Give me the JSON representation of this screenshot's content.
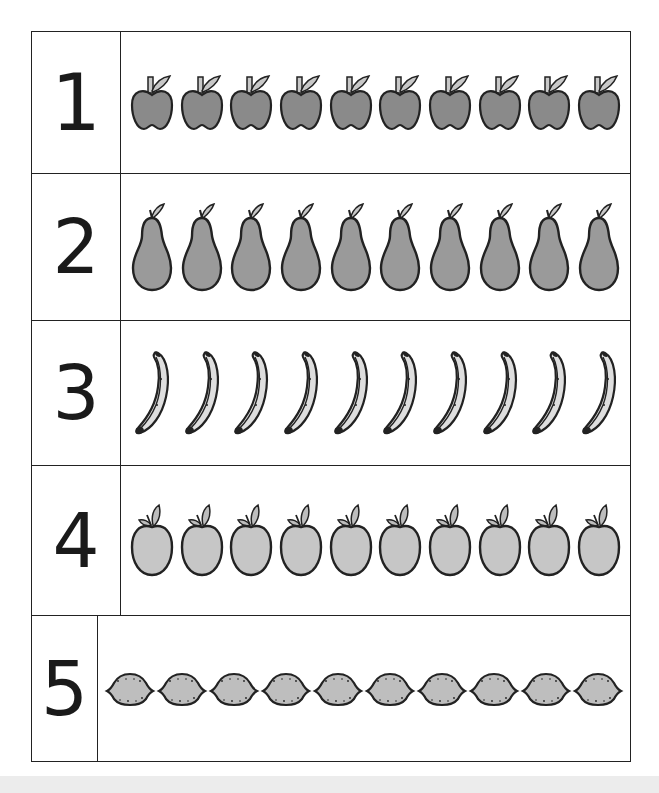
{
  "worksheet": {
    "title": "Counting fruit 1-5",
    "rows": [
      {
        "number": "1",
        "fruit": "apple",
        "count": 10,
        "fill": "#8a8a8a",
        "leaf": "#c8c8c8"
      },
      {
        "number": "2",
        "fruit": "pear",
        "count": 10,
        "fill": "#9a9a9a",
        "leaf": "#c8c8c8"
      },
      {
        "number": "3",
        "fruit": "banana",
        "count": 10,
        "fill": "#dedede",
        "leaf": "#222222"
      },
      {
        "number": "4",
        "fruit": "round-apple",
        "count": 10,
        "fill": "#c6c6c6",
        "leaf": "#bdbdbd"
      },
      {
        "number": "5",
        "fruit": "lemon",
        "count": 10,
        "fill": "#bebebe",
        "leaf": "#222222"
      }
    ]
  },
  "colors": {
    "outline": "#222222",
    "background": "#ffffff",
    "bottom_strip": "#ececec"
  }
}
